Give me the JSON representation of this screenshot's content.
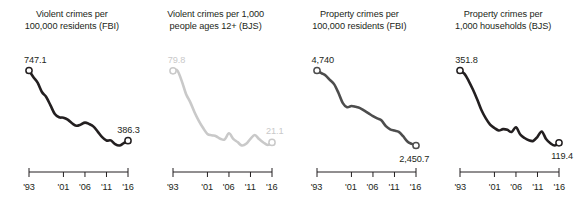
{
  "chart_data": [
    {
      "type": "line",
      "title": "Violent crimes per\n100,000 residents (FBI)",
      "title_line1": "Violent crimes per",
      "title_line2": "100,000 residents (FBI)",
      "source": "FBI",
      "measure": "Violent crimes per 100,000 residents",
      "color": "#231f20",
      "label_color": "#231f20",
      "grid": false,
      "legend": "none",
      "xlabel": "",
      "ylabel": "",
      "xlim": [
        1993,
        2016
      ],
      "ylim": [
        0,
        800
      ],
      "tick_labels": [
        "'93",
        "'01",
        "'06",
        "'11",
        "'16"
      ],
      "tick_years": [
        1993,
        2001,
        2006,
        2011,
        2016
      ],
      "start_label": "747.1",
      "end_label": "386.3",
      "x": [
        1993,
        1994,
        1995,
        1996,
        1997,
        1998,
        1999,
        2000,
        2001,
        2002,
        2003,
        2004,
        2005,
        2006,
        2007,
        2008,
        2009,
        2010,
        2011,
        2012,
        2013,
        2014,
        2015,
        2016
      ],
      "values": [
        747.1,
        713.6,
        684.5,
        636.6,
        611.0,
        567.6,
        523.0,
        506.5,
        504.5,
        494.4,
        475.8,
        463.2,
        469.0,
        479.3,
        471.8,
        458.6,
        431.9,
        404.5,
        387.1,
        387.8,
        369.1,
        361.6,
        373.7,
        386.3
      ]
    },
    {
      "type": "line",
      "title": "Violent crimes per 1,000\npeople ages 12+ (BJS)",
      "title_line1": "Violent crimes per 1,000",
      "title_line2": "people ages 12+ (BJS)",
      "source": "BJS",
      "measure": "Violent crimes per 1,000 people ages 12+",
      "color": "#c9c9c9",
      "label_color": "#c9c9c9",
      "grid": false,
      "legend": "none",
      "xlabel": "",
      "ylabel": "",
      "xlim": [
        1993,
        2016
      ],
      "ylim": [
        0,
        85
      ],
      "tick_labels": [
        "'93",
        "'01",
        "'06",
        "'11",
        "'16"
      ],
      "tick_years": [
        1993,
        2001,
        2006,
        2011,
        2016
      ],
      "start_label": "79.8",
      "end_label": "21.1",
      "x": [
        1993,
        1994,
        1995,
        1996,
        1997,
        1998,
        1999,
        2000,
        2001,
        2002,
        2003,
        2004,
        2005,
        2006,
        2007,
        2008,
        2009,
        2010,
        2011,
        2012,
        2013,
        2014,
        2015,
        2016
      ],
      "values": [
        79.8,
        80.1,
        71.8,
        61.1,
        54.2,
        45.9,
        38.8,
        32.9,
        28.1,
        27.0,
        26.2,
        24.1,
        23.5,
        28.6,
        24.0,
        21.4,
        18.6,
        20.0,
        24.1,
        27.2,
        23.9,
        21.1,
        19.0,
        21.1
      ]
    },
    {
      "type": "line",
      "title": "Property crimes per\n100,000 residents (FBI)",
      "title_line1": "Property crimes per",
      "title_line2": "100,000 residents (FBI)",
      "source": "FBI",
      "measure": "Property crimes per 100,000 residents",
      "color": "#4d4d4d",
      "label_color": "#231f20",
      "grid": false,
      "legend": "none",
      "xlabel": "",
      "ylabel": "",
      "xlim": [
        1993,
        2016
      ],
      "ylim": [
        0,
        5000
      ],
      "tick_labels": [
        "'93",
        "'01",
        "'06",
        "'11",
        "'16"
      ],
      "tick_years": [
        1993,
        2001,
        2006,
        2011,
        2016
      ],
      "start_label": "4,740",
      "end_label": "2,450.7",
      "x": [
        1993,
        1994,
        1995,
        1996,
        1997,
        1998,
        1999,
        2000,
        2001,
        2002,
        2003,
        2004,
        2005,
        2006,
        2007,
        2008,
        2009,
        2010,
        2011,
        2012,
        2013,
        2014,
        2015,
        2016
      ],
      "values": [
        4740.0,
        4660.2,
        4590.5,
        4451.0,
        4316.3,
        4052.5,
        3743.6,
        3618.3,
        3658.1,
        3630.6,
        3591.2,
        3514.1,
        3431.5,
        3346.6,
        3276.4,
        3214.6,
        3041.3,
        2945.9,
        2905.4,
        2868.0,
        2733.6,
        2574.1,
        2500.5,
        2450.7
      ]
    },
    {
      "type": "line",
      "title": "Property crimes per\n1,000 households (BJS)",
      "title_line1": "Property crimes per",
      "title_line2": "1,000 households (BJS)",
      "source": "BJS",
      "measure": "Property crimes per 1,000 households",
      "color": "#231f20",
      "label_color": "#231f20",
      "grid": false,
      "legend": "none",
      "xlabel": "",
      "ylabel": "",
      "xlim": [
        1993,
        2016
      ],
      "ylim": [
        0,
        380
      ],
      "tick_labels": [
        "'93",
        "'01",
        "'06",
        "'11",
        "'16"
      ],
      "tick_years": [
        1993,
        2001,
        2006,
        2011,
        2016
      ],
      "start_label": "351.8",
      "end_label": "119.4",
      "x": [
        1993,
        1994,
        1995,
        1996,
        1997,
        1998,
        1999,
        2000,
        2001,
        2002,
        2003,
        2004,
        2005,
        2006,
        2007,
        2008,
        2009,
        2010,
        2011,
        2012,
        2013,
        2014,
        2015,
        2016
      ],
      "values": [
        351.8,
        341.5,
        318.8,
        290.5,
        258.6,
        224.0,
        198.0,
        178.1,
        166.9,
        159.0,
        163.2,
        161.1,
        154.0,
        169.0,
        146.0,
        134.7,
        127.4,
        125.4,
        138.7,
        155.8,
        131.4,
        118.1,
        110.7,
        119.4
      ]
    }
  ]
}
